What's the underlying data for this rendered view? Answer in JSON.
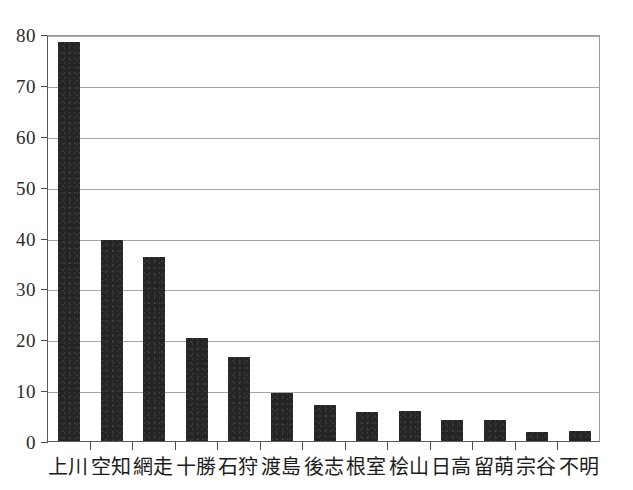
{
  "chart_data": {
    "type": "bar",
    "title": "",
    "subtitle": "",
    "xlabel": "",
    "ylabel": "",
    "categories": [
      "上川",
      "空知",
      "網走",
      "十勝",
      "石狩",
      "渡島",
      "後志",
      "根室",
      "桧山",
      "日高",
      "留萌",
      "宗谷",
      "不明"
    ],
    "values": [
      78.5,
      39.5,
      36.2,
      20.3,
      16.5,
      9.5,
      7.0,
      5.7,
      5.9,
      4.1,
      4.2,
      1.8,
      1.9
    ],
    "ylim": [
      0,
      80
    ],
    "yticks": [
      0,
      10,
      20,
      30,
      40,
      50,
      60,
      70,
      80
    ],
    "ytick_labels": [
      "0",
      "10",
      "20",
      "30",
      "40",
      "50",
      "60",
      "70",
      "80"
    ],
    "grid": true,
    "grid_axis": "y",
    "legend": false,
    "legend_position": "none",
    "bar_color": "#252525",
    "grid_color": "#a6a6a6",
    "axis_color": "#5a5a5a",
    "background_color": "#ffffff"
  }
}
